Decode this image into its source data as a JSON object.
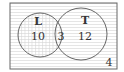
{
  "diagram": {
    "type": "venn",
    "sets": [
      {
        "name": "L",
        "only_count": "10"
      },
      {
        "name": "T",
        "only_count": "12"
      }
    ],
    "intersection_count": "3",
    "outside_count": "4",
    "shading": {
      "L": "crosshatch",
      "rest": "horizontal-lines"
    },
    "colors": {
      "stroke": "#555555",
      "grid": "#d0d0d0",
      "text": "#333333"
    }
  }
}
